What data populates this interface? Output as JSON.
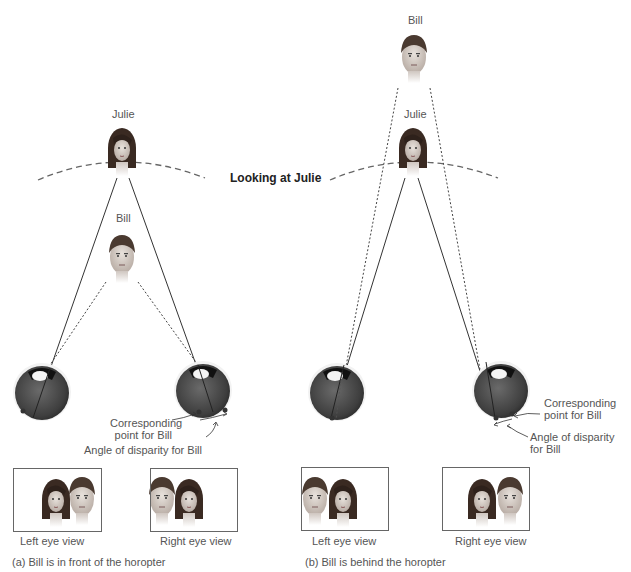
{
  "center_label": "Looking at Julie",
  "panel_a": {
    "caption": "(a) Bill is in front of the horopter",
    "julie_label": "Julie",
    "bill_label": "Bill",
    "corresponding_label_1": "Corresponding",
    "corresponding_label_2": "point for Bill",
    "disparity_label": "Angle of disparity for Bill",
    "left_view_label": "Left eye view",
    "right_view_label": "Right eye view",
    "left_view_order": [
      "Julie",
      "Bill"
    ],
    "right_view_order": [
      "Bill",
      "Julie"
    ]
  },
  "panel_b": {
    "caption": "(b) Bill is behind the horopter",
    "julie_label": "Julie",
    "bill_label": "Bill",
    "corresponding_label_1": "Corresponding",
    "corresponding_label_2": "point for Bill",
    "disparity_label_1": "Angle of disparity",
    "disparity_label_2": "for Bill",
    "left_view_label": "Left eye view",
    "right_view_label": "Right eye view",
    "left_view_order": [
      "Bill",
      "Julie"
    ],
    "right_view_order": [
      "Julie",
      "Bill"
    ]
  },
  "colors": {
    "line": "#333333",
    "horopter": "#666666",
    "eye": "#4a4a4a",
    "hair_julie": "#3a2a22",
    "hair_bill": "#4a3a30",
    "skin": "#d8cfc8"
  }
}
